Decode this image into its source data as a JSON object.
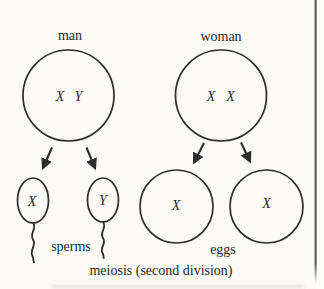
{
  "caption": "meiosis (second division)",
  "colors": {
    "ink": "#2d2d2d",
    "background": "#fbfaf7",
    "page_edge_line": "#5c5c5c"
  },
  "man_column": {
    "title": "man",
    "parent_cell": {
      "chromosome_1": "X",
      "chromosome_2": "Y"
    },
    "gamete_left": {
      "chromosome": "X"
    },
    "gamete_right": {
      "chromosome": "Y"
    },
    "gametes_label": "sperms"
  },
  "woman_column": {
    "title": "woman",
    "parent_cell": {
      "chromosome_1": "X",
      "chromosome_2": "X"
    },
    "gamete_left": {
      "chromosome": "X"
    },
    "gamete_right": {
      "chromosome": "X"
    },
    "gametes_label": "eggs"
  }
}
